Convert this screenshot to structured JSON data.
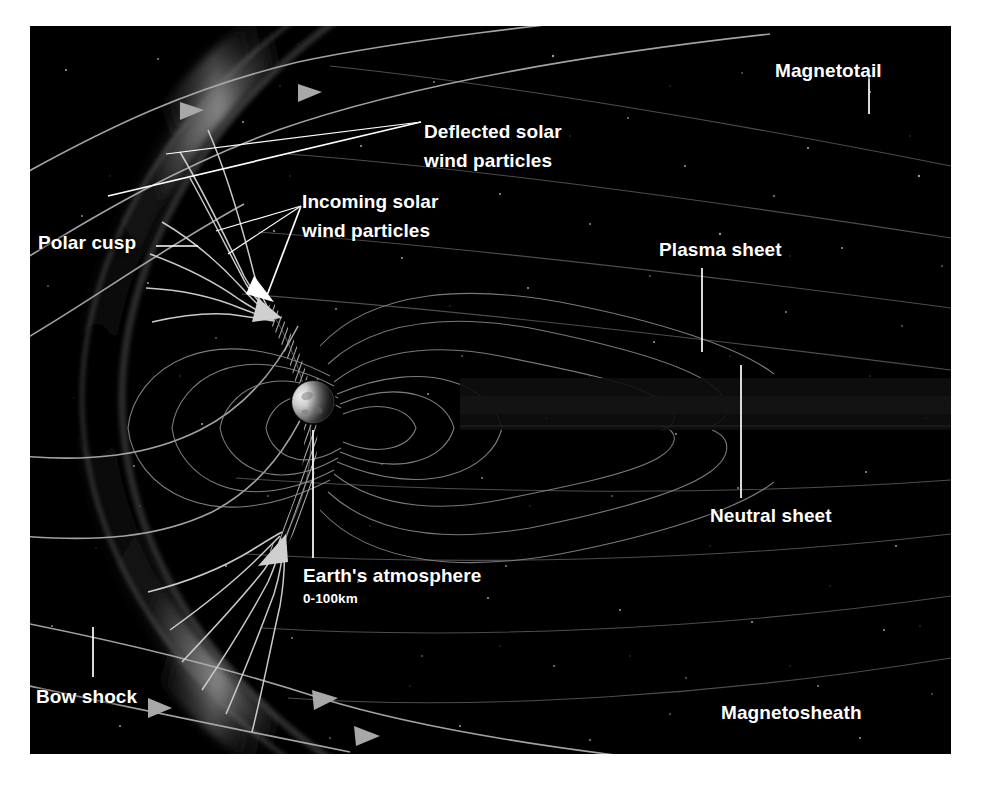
{
  "figure": {
    "background_color": "#000000",
    "page_color": "#ffffff",
    "label_color": "#ffffff",
    "fieldline_color": "#9a9a9a",
    "bowshock_glow_color": "#8d8d8d",
    "plate": {
      "x": 30,
      "y": 26,
      "width": 921,
      "height": 728
    }
  },
  "labels": [
    {
      "id": "magnetotail",
      "text": "Magnetotail",
      "x": 745,
      "y": 42,
      "size": "big"
    },
    {
      "id": "deflected",
      "text": "Deflected solar",
      "x": 424,
      "y": 103,
      "size": "big"
    },
    {
      "id": "deflected2",
      "text": "wind particles",
      "x": 424,
      "y": 132,
      "size": "big"
    },
    {
      "id": "incoming",
      "text": "Incoming solar",
      "x": 302,
      "y": 192,
      "size": "big"
    },
    {
      "id": "incoming2",
      "text": "wind particles",
      "x": 302,
      "y": 221,
      "size": "big"
    },
    {
      "id": "plasma-sheet",
      "text": "Plasma sheet",
      "x": 659,
      "y": 240,
      "size": "big"
    },
    {
      "id": "polar-cusp",
      "text": "Polar cusp",
      "x": 38,
      "y": 233,
      "size": "big"
    },
    {
      "id": "neutral-sheet",
      "text": "Neutral sheet",
      "x": 710,
      "y": 505,
      "size": "big"
    },
    {
      "id": "earths-atmosphere",
      "text": "Earth's atmosphere",
      "x": 303,
      "y": 565,
      "size": "big"
    },
    {
      "id": "atmosphere-range",
      "text": "0-100km",
      "x": 303,
      "y": 590,
      "size": "sub"
    },
    {
      "id": "bow-shock",
      "text": "Bow shock",
      "x": 36,
      "y": 686,
      "size": "big"
    },
    {
      "id": "magnetosheath",
      "text": "Magnetosheath",
      "x": 721,
      "y": 702,
      "size": "big"
    }
  ],
  "leader_lines": [
    {
      "id": "magnetotail-leader",
      "x1": 869,
      "y1": 74,
      "x2": 869,
      "y2": 114
    },
    {
      "id": "plasma-sheet-leader",
      "x1": 702,
      "y1": 268,
      "x2": 702,
      "y2": 352
    },
    {
      "id": "neutral-sheet-leader",
      "x1": 741,
      "y1": 365,
      "x2": 741,
      "y2": 498
    },
    {
      "id": "polar-cusp-leader",
      "x1": 156,
      "y1": 246,
      "x2": 198,
      "y2": 246
    },
    {
      "id": "bow-shock-leader",
      "x1": 93,
      "y1": 627,
      "x2": 93,
      "y2": 677
    },
    {
      "id": "atmosphere-leader",
      "x1": 313,
      "y1": 430,
      "x2": 313,
      "y2": 558
    },
    {
      "id": "deflected-pointer-1",
      "x1": 417,
      "y1": 122,
      "x2": 108,
      "y2": 196
    },
    {
      "id": "deflected-pointer-2",
      "x1": 417,
      "y1": 122,
      "x2": 163,
      "y2": 153
    },
    {
      "id": "incoming-pointer-1",
      "x1": 297,
      "y1": 206,
      "x2": 216,
      "y2": 230
    },
    {
      "id": "incoming-pointer-2",
      "x1": 297,
      "y1": 206,
      "x2": 255,
      "y2": 288
    },
    {
      "id": "incoming-pointer-3",
      "x1": 297,
      "y1": 206,
      "x2": 225,
      "y2": 254
    }
  ],
  "earth": {
    "name": "Earth",
    "cx": 313,
    "cy": 402,
    "r": 21,
    "lit_side": "left",
    "lit_color": "#d8d8d8",
    "dark_color": "#2c2c2c"
  },
  "features": [
    {
      "id": "bow-shock",
      "name": "Bow shock",
      "kind": "arc-glow"
    },
    {
      "id": "magnetopause",
      "name": "Magnetopause (hatched)",
      "kind": "hatched-boundary"
    },
    {
      "id": "polar-cusp-n",
      "name": "Northern polar cusp",
      "kind": "cusp-funnel"
    },
    {
      "id": "polar-cusp-s",
      "name": "Southern polar cusp",
      "kind": "cusp-funnel"
    },
    {
      "id": "plasma-sheet",
      "name": "Plasma sheet",
      "kind": "tail-region"
    },
    {
      "id": "neutral-sheet",
      "name": "Neutral sheet",
      "kind": "tail-midplane"
    },
    {
      "id": "magnetotail",
      "name": "Magnetotail",
      "kind": "tail-region"
    },
    {
      "id": "magnetosheath",
      "name": "Magnetosheath",
      "kind": "shocked-flow-region"
    },
    {
      "id": "solar-wind",
      "name": "Solar wind streamlines",
      "kind": "flow-arrows"
    },
    {
      "id": "field-lines",
      "name": "Geomagnetic field lines",
      "kind": "dipole-loops"
    }
  ],
  "ghost_strip": {
    "text": " "
  }
}
